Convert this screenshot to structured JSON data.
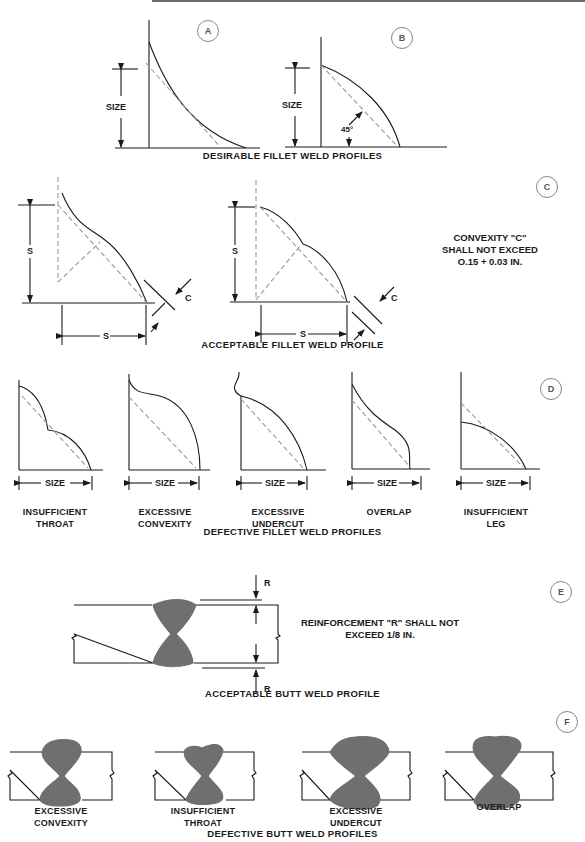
{
  "sections": {
    "a": {
      "badge": "A"
    },
    "b": {
      "badge": "B",
      "angle": "45°"
    },
    "desirable": {
      "caption": "DESIRABLE FILLET WELD PROFILES",
      "size_label": "SIZE"
    },
    "c": {
      "badge": "C",
      "caption": "ACCEPTABLE FILLET WELD PROFILE",
      "dim_s": "S",
      "dim_c": "C",
      "note": [
        "CONVEXITY \"C\"",
        "SHALL NOT EXCEED",
        "O.15 + 0.03 IN."
      ]
    },
    "d": {
      "badge": "D",
      "caption": "DEFECTIVE FILLET WELD PROFILES",
      "size_label": "SIZE",
      "items": [
        {
          "label": [
            "INSUFFICIENT",
            "THROAT"
          ]
        },
        {
          "label": [
            "EXCESSIVE",
            "CONVEXITY"
          ]
        },
        {
          "label": [
            "EXCESSIVE",
            "UNDERCUT"
          ]
        },
        {
          "label": [
            "OVERLAP",
            ""
          ]
        },
        {
          "label": [
            "INSUFFICIENT",
            "LEG"
          ]
        }
      ]
    },
    "e": {
      "badge": "E",
      "caption": "ACCEPTABLE BUTT WELD PROFILE",
      "dim_r": "R",
      "note": [
        "REINFORCEMENT \"R\" SHALL NOT",
        "EXCEED 1/8 IN."
      ]
    },
    "f": {
      "badge": "F",
      "caption": "DEFECTIVE BUTT WELD PROFILES",
      "items": [
        {
          "label": [
            "EXCESSIVE",
            "CONVEXITY"
          ]
        },
        {
          "label": [
            "INSUFFICIENT",
            "THROAT"
          ]
        },
        {
          "label": [
            "EXCESSIVE",
            "UNDERCUT"
          ]
        },
        {
          "label": [
            "OVERLAP",
            ""
          ]
        }
      ]
    }
  },
  "colors": {
    "line": "#1a1a1a",
    "dashed": "#999999",
    "weld_fill": "#6f6f6f",
    "badge": "#888888"
  }
}
